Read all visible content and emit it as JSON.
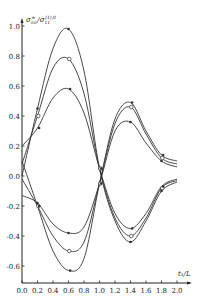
{
  "chart_data": {
    "type": "line",
    "title": "",
    "xlabel": "t1/L",
    "ylabel": "σ_nn^± / σ_11^(1),0",
    "xlim": [
      0.0,
      2.0
    ],
    "ylim": [
      -0.7,
      1.0
    ],
    "grid": false,
    "legend": null,
    "x_ticks": [
      "0.0",
      "0.2",
      "0.4",
      "0.6",
      "0.8",
      "1.0",
      "1.2",
      "1.4",
      "1.6",
      "1.8",
      "2.0"
    ],
    "y_ticks": [
      "1.0",
      "0.8",
      "0.6",
      "0.4",
      "0.2",
      "0.0",
      "-0.2",
      "-0.4",
      "-0.6"
    ],
    "x": [
      0.0,
      0.2,
      0.4,
      0.6,
      0.8,
      1.0,
      1.2,
      1.4,
      1.6,
      1.8,
      2.0
    ],
    "series": [
      {
        "name": "upper-1",
        "marker": "filled",
        "values": [
          0.0,
          0.45,
          0.85,
          0.98,
          0.7,
          0.05,
          -0.3,
          -0.44,
          -0.3,
          -0.1,
          -0.04
        ]
      },
      {
        "name": "upper-2",
        "marker": "open",
        "values": [
          0.08,
          0.4,
          0.72,
          0.78,
          0.55,
          0.05,
          -0.28,
          -0.4,
          -0.28,
          -0.08,
          -0.03
        ]
      },
      {
        "name": "upper-3",
        "marker": "filled",
        "values": [
          0.2,
          0.32,
          0.52,
          0.58,
          0.42,
          0.05,
          -0.25,
          -0.35,
          -0.25,
          -0.07,
          -0.02
        ]
      },
      {
        "name": "lower-1",
        "marker": "filled",
        "values": [
          -0.13,
          -0.18,
          -0.32,
          -0.38,
          -0.34,
          -0.05,
          0.3,
          0.36,
          0.22,
          0.1,
          0.06
        ]
      },
      {
        "name": "lower-2",
        "marker": "open",
        "values": [
          -0.02,
          -0.2,
          -0.4,
          -0.5,
          -0.44,
          -0.05,
          0.35,
          0.46,
          0.28,
          0.12,
          0.08
        ]
      },
      {
        "name": "lower-3",
        "marker": "filled",
        "values": [
          0.1,
          -0.2,
          -0.5,
          -0.63,
          -0.55,
          -0.05,
          0.38,
          0.49,
          0.3,
          0.14,
          0.1
        ]
      }
    ]
  },
  "labels": {
    "ylabel_main": "σ",
    "ylabel_sub": "nn",
    "ylabel_sup": "±",
    "ylabel_den": "σ",
    "ylabel_den_sub": "11",
    "ylabel_den_sup": "(1),0",
    "xlabel": "t₁/L"
  }
}
